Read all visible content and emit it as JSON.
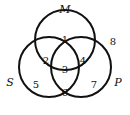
{
  "diagram": {
    "type": "venn",
    "sets": [
      {
        "label": "M",
        "cx": 65,
        "cy": 40,
        "r": 30
      },
      {
        "label": "S",
        "cx": 49,
        "cy": 67,
        "r": 30
      },
      {
        "label": "P",
        "cx": 81,
        "cy": 67,
        "r": 30
      }
    ],
    "regions": [
      {
        "label": "1",
        "x": 65,
        "y": 43
      },
      {
        "label": "2",
        "x": 46,
        "y": 64
      },
      {
        "label": "3",
        "x": 65,
        "y": 73
      },
      {
        "label": "4",
        "x": 83,
        "y": 64
      },
      {
        "label": "5",
        "x": 36,
        "y": 88
      },
      {
        "label": "6",
        "x": 65,
        "y": 96
      },
      {
        "label": "7",
        "x": 94,
        "y": 88
      },
      {
        "label": "8",
        "x": 113,
        "y": 45
      }
    ],
    "set_labels": [
      {
        "label": "M",
        "x": 65,
        "y": 13
      },
      {
        "label": "S",
        "x": 10,
        "y": 86
      },
      {
        "label": "P",
        "x": 118,
        "y": 86
      }
    ]
  }
}
